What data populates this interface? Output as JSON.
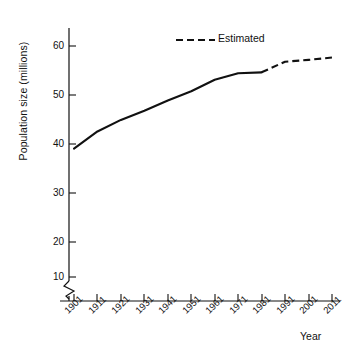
{
  "chart_data": {
    "type": "line",
    "title": "",
    "xlabel": "Year",
    "ylabel": "Population size (millions)",
    "x": [
      1901,
      1911,
      1921,
      1931,
      1941,
      1951,
      1961,
      1971,
      1981,
      1991,
      2001,
      2011
    ],
    "xtick_labels": [
      "1901",
      "1911",
      "1921",
      "1931",
      "1941",
      "1951",
      "1961",
      "1971",
      "1981",
      "1991",
      "2001",
      "2011"
    ],
    "ytick_labels": [
      "10",
      "20",
      "30",
      "40",
      "50",
      "60"
    ],
    "ytick_values": [
      10,
      20,
      30,
      40,
      50,
      60
    ],
    "ylim": [
      5,
      65
    ],
    "xlim": [
      1901,
      2011
    ],
    "y_axis_break": true,
    "grid": false,
    "legend_position": "top-right",
    "series": [
      {
        "name": "Observed",
        "style": "solid",
        "x": [
          1901,
          1911,
          1921,
          1931,
          1941,
          1951,
          1961,
          1971,
          1981
        ],
        "values": [
          37.8,
          41.5,
          44.0,
          46.0,
          48.2,
          50.2,
          52.7,
          54.1,
          54.3
        ]
      },
      {
        "name": "Estimated",
        "style": "dashed",
        "x": [
          1981,
          1991,
          2001,
          2011
        ],
        "values": [
          54.3,
          56.6,
          57.0,
          57.5
        ]
      }
    ],
    "legend": [
      {
        "label": "Estimated",
        "style": "dashed"
      }
    ]
  },
  "axes": {
    "y_title": "Population size (millions)",
    "x_title": "Year"
  },
  "legend": {
    "estimated_label": "Estimated"
  },
  "colors": {
    "line": "#111111",
    "axis": "#111111",
    "background": "#ffffff"
  }
}
